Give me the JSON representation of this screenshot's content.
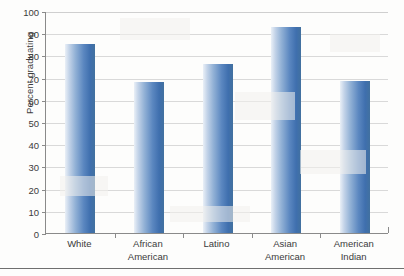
{
  "chart_data": {
    "type": "bar",
    "title": "",
    "xlabel": "",
    "ylabel": "Percent graduating",
    "categories": [
      "White",
      "African\nAmerican",
      "Latino",
      "Asian\nAmerican",
      "American\nIndian"
    ],
    "values": [
      85,
      68,
      76,
      93,
      68.5
    ],
    "ylim": [
      0,
      100
    ],
    "ytick_labels": [
      "0",
      "10",
      "20",
      "30",
      "40",
      "50",
      "60",
      "70",
      "80",
      "90",
      "100"
    ],
    "ytick_values": [
      0,
      10,
      20,
      30,
      40,
      50,
      60,
      70,
      80,
      90,
      100
    ],
    "grid": true,
    "legend": false,
    "series": [
      {
        "name": "Percent graduating",
        "values": [
          85,
          68,
          76,
          93,
          68.5
        ]
      }
    ],
    "colors": {
      "bar_light": "#c3d3e8",
      "bar_mid": "#5b87c0",
      "bar_dark": "#3f6fae",
      "gridline": "#d9d9d9",
      "axis": "#8a8a8a",
      "text": "#3b3b3b",
      "background": "#fdfdfc"
    }
  }
}
